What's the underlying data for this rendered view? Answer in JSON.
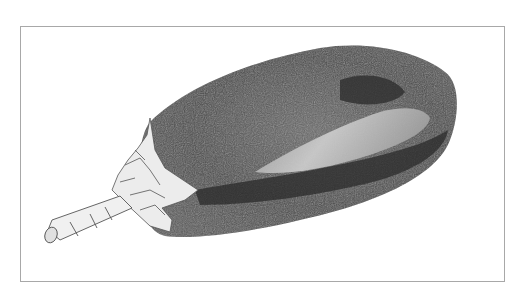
{
  "image": {
    "subject": "eggplant",
    "style": "pencil sketch",
    "colors": {
      "background": "#ffffff",
      "frame": "#a8a8a8",
      "body_dark": "#3a3a3a",
      "body_mid": "#5e5e5e",
      "highlight": "#c8c8c8",
      "calyx": "#e6e6e6"
    }
  }
}
